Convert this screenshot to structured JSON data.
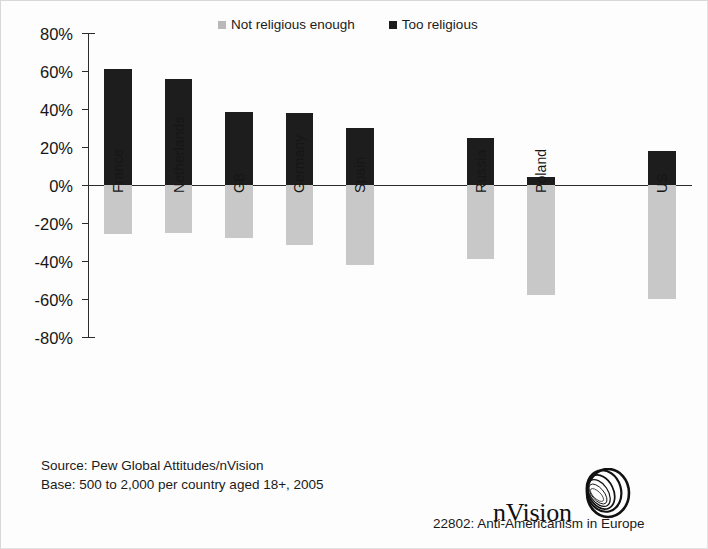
{
  "legend": {
    "entries": [
      {
        "label": "Not religious enough",
        "color": "#b9b9b9",
        "icon": "square-swatch-icon"
      },
      {
        "label": "Too religious",
        "color": "#1c1c1c",
        "icon": "square-swatch-icon"
      }
    ]
  },
  "footer": {
    "source_line": "Source: Pew Global Attitudes/nVision",
    "base_line": "Base: 500 to 2,000 per country aged 18+, 2005",
    "brand": "nVision",
    "brand_mark": "nvision-swirl-logo-icon",
    "report": "22802: Anti-Americanism in Europe"
  },
  "chart_data": {
    "type": "bar",
    "title": "",
    "subtitle": "",
    "xlabel": "",
    "ylabel": "",
    "ylim": [
      -80,
      80
    ],
    "grid": false,
    "legend_position": "top",
    "orientation": "vertical",
    "stacked": false,
    "axis_zero_line": true,
    "ytick_labels": [
      "80%",
      "60%",
      "40%",
      "20%",
      "0%",
      "-20%",
      "-40%",
      "-60%",
      "-80%"
    ],
    "ytick_values": [
      80,
      60,
      40,
      20,
      0,
      -20,
      -40,
      -60,
      -80
    ],
    "categories": [
      "France",
      "Netherlands",
      "GB",
      "Germany",
      "Spain",
      "",
      "Russia",
      "Poland",
      "",
      "US"
    ],
    "series": [
      {
        "name": "Too religious",
        "color": "#1d1d1d",
        "values": [
          61,
          56,
          38.5,
          38,
          30,
          null,
          25,
          4,
          null,
          18
        ]
      },
      {
        "name": "Not religious enough",
        "color": "#c8c8c8",
        "values": [
          -26,
          -25,
          -28,
          -31.5,
          -42,
          null,
          -39,
          -58,
          null,
          -60
        ]
      }
    ]
  }
}
